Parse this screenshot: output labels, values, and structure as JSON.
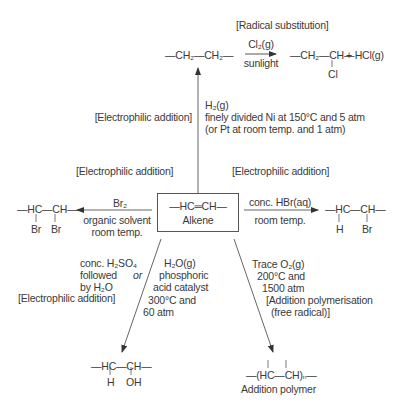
{
  "diagram": {
    "center": {
      "formula": "—HC═CH—",
      "label": "Alkene"
    },
    "top": {
      "mechanism": "[Radical substitution]",
      "reactant": "—CH₂—CH₂—",
      "reagent": "Cl₂(g)",
      "condition": "sunlight",
      "product_main": "—CH₂—CH—",
      "product_sub": "Cl",
      "product_extra": "+ HCl(g)"
    },
    "hydrogenation": {
      "mechanism": "[Electrophilic addition]",
      "reagent": "H₂(g)",
      "condition_1": "finely divided Ni at 150°C and 5 atm",
      "condition_2": "(or Pt at room temp. and 1 atm)"
    },
    "left": {
      "mechanism": "[Electrophilic addition]",
      "reagent": "Br₂",
      "condition_1": "organic solvent",
      "condition_2": "room temp.",
      "product_main": "—HC—CH—",
      "product_sub_1": "Br",
      "product_sub_2": "Br"
    },
    "right": {
      "mechanism": "[Electrophilic addition]",
      "reagent": "conc. HBr(aq)",
      "condition": "room temp.",
      "product_main": "—HC—CH—",
      "product_sub_1": "H",
      "product_sub_2": "Br"
    },
    "hydration": {
      "route_1_line1": "conc. H₂SO₄",
      "route_1_line2": "followed",
      "route_1_line3": "by H₂O",
      "or": "or",
      "route_2_line1": "H₂O(g)",
      "route_2_line2": "phosphoric",
      "route_2_line3": "acid catalyst",
      "route_2_line4": "300°C and",
      "route_2_line5": "60 atm",
      "mechanism": "[Electrophilic addition]",
      "product_main": "—HC—CH—",
      "product_sub_1": "H",
      "product_sub_2": "OH"
    },
    "polymerisation": {
      "reagent": "Trace O₂(g)",
      "condition_1": "200°C and",
      "condition_2": "1500 atm",
      "mechanism_1": "[Addition polymerisation",
      "mechanism_2": "(free radical)]",
      "product_main": "—(HC—CH)ₙ—",
      "product_label": "Addition polymer"
    },
    "colors": {
      "ink": "#3a3a3a",
      "line": "#555555",
      "background": "#ffffff"
    }
  }
}
